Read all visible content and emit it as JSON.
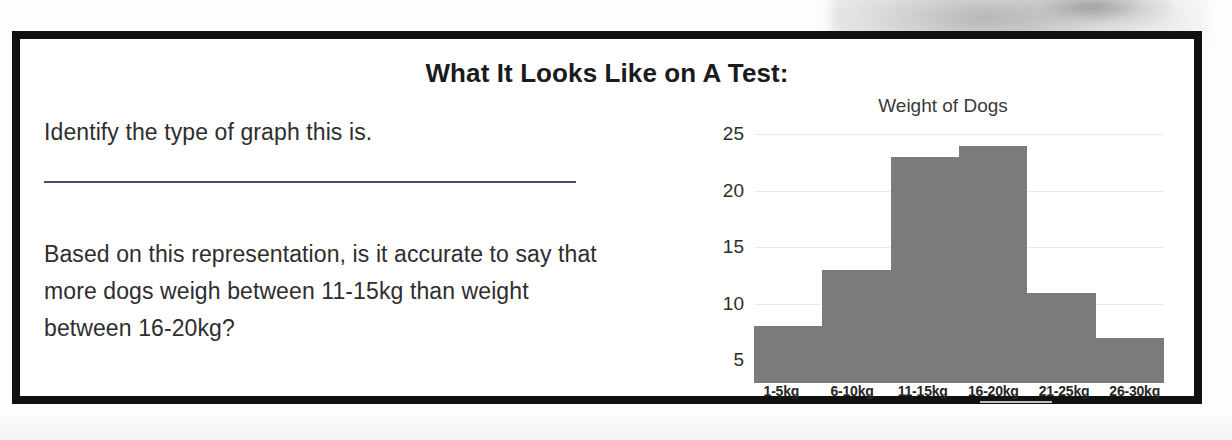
{
  "slide": {
    "title": "What It Looks Like on A Test:",
    "questions": [
      "Identify the type of graph this is.",
      "Based on this representation, is it accurate to say that more dogs weigh between 11-15kg than weight between 16-20kg?"
    ],
    "answer_rule_label": "answer-line"
  },
  "chart_data": {
    "type": "bar",
    "title": "Weight of Dogs",
    "xlabel": "",
    "ylabel": "",
    "categories": [
      "1-5kg",
      "6-10kg",
      "11-15kg",
      "16-20kg",
      "21-25kg",
      "26-30kg"
    ],
    "values": [
      8,
      13,
      23,
      24,
      11,
      7
    ],
    "ylim": [
      3,
      26
    ],
    "yticks": [
      25,
      20,
      15,
      10,
      5
    ],
    "gridlines": true,
    "legend": "none",
    "bar_color": "#7b7b7b",
    "grid_color": "#ebebeb",
    "axis_text_color": "#2d2d2d"
  },
  "colors": {
    "frame": "#111111",
    "slide_background": "#ffffff",
    "text": "#2e2e2e",
    "rule": "#4a4a6a"
  }
}
